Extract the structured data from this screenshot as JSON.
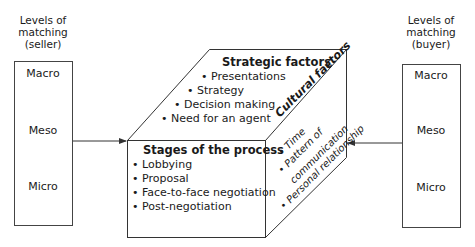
{
  "seller": {
    "caption": [
      "Levels of",
      "matching",
      "(seller)"
    ],
    "levels": [
      "Macro",
      "Meso",
      "Micro"
    ]
  },
  "buyer": {
    "caption": [
      "Levels of",
      "matching",
      "(buyer)"
    ],
    "levels": [
      "Macro",
      "Meso",
      "Micro"
    ]
  },
  "cube": {
    "top": {
      "title": "Strategic factors",
      "items": [
        "• Presentations",
        "• Strategy",
        "• Decision making",
        "• Need for an agent"
      ]
    },
    "front": {
      "title": "Stages of the process",
      "items": [
        "• Lobbying",
        "• Proposal",
        "• Face-to-face negotiation",
        "• Post-negotiation"
      ]
    },
    "side": {
      "title": "Cultural factors",
      "items": [
        "• Time",
        "• Pattern of",
        "communication",
        "• Personal relationship"
      ]
    }
  },
  "colors": {
    "line": "#333333",
    "text": "#1a1a1a"
  }
}
